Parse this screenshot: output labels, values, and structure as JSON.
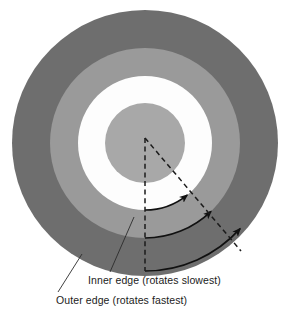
{
  "figure": {
    "name": "rotating-annulus-differential-rotation-diagram",
    "background_color": "#ffffff"
  },
  "rings": {
    "outer_ring": {
      "label": "outer-ring",
      "color": "#6e6e6e",
      "center_x": 145,
      "center_y": 143,
      "radius": 133
    },
    "middle_ring": {
      "label": "middle-ring",
      "color": "#9a9a9a",
      "center_x": 145,
      "center_y": 143,
      "radius": 95
    },
    "white_ring": {
      "label": "white-gap-ring",
      "color": "#fdfdfd",
      "center_x": 145,
      "center_y": 143,
      "radius": 67
    },
    "core": {
      "label": "inner-core-disc",
      "color": "#a8a8a8",
      "center_x": 145,
      "center_y": 143,
      "radius": 40
    }
  },
  "radial_lines": {
    "vertical": {
      "label": "reference-radius-vertical",
      "style": "dashed",
      "color": "#1b1b1b",
      "x1": 145,
      "y1": 138,
      "x2": 145,
      "y2": 271
    },
    "diagonal": {
      "label": "displaced-radius-diagonal",
      "style": "dashed",
      "color": "#1b1b1b",
      "x1": 145,
      "y1": 138,
      "x2": 241,
      "y2": 251
    }
  },
  "arrows": [
    {
      "name": "rotation-arrow-inner",
      "description": "inner edge rotation arc (slowest)",
      "radius": 67,
      "color": "#111111"
    },
    {
      "name": "rotation-arrow-middle",
      "description": "middle rotation arc",
      "radius": 95,
      "color": "#111111"
    },
    {
      "name": "rotation-arrow-outer",
      "description": "outer edge rotation arc (fastest)",
      "radius": 128,
      "color": "#111111"
    }
  ],
  "labels": {
    "inner_edge": {
      "text": "Inner edge (rotates slowest)",
      "x": 88,
      "y": 284,
      "leader": {
        "x1": 134,
        "y1": 217,
        "x2": 110,
        "y2": 272
      }
    },
    "outer_edge": {
      "text": "Outer edge (rotates fastest)",
      "x": 56,
      "y": 304,
      "leader": {
        "x1": 82,
        "y1": 254,
        "x2": 58,
        "y2": 292
      }
    }
  }
}
